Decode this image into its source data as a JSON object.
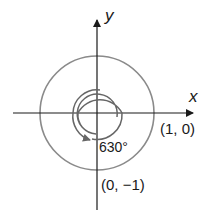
{
  "diagram": {
    "axes": {
      "x_label": "x",
      "y_label": "y"
    },
    "angle_label": "630°",
    "points": [
      {
        "label": "(1, 0)"
      },
      {
        "label": "(0, −1)"
      }
    ],
    "colors": {
      "circle": "#8a8a8a",
      "axis": "#1a1a1a",
      "spiral": "#666666"
    }
  }
}
